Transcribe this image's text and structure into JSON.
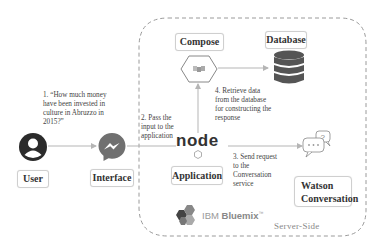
{
  "nodes": {
    "user": {
      "label": "User",
      "icon": "user-icon"
    },
    "interface": {
      "label": "Interface",
      "icon": "messenger-icon"
    },
    "compose": {
      "label": "Compose",
      "icon": "compose-hexagon-icon"
    },
    "database": {
      "label": "Database",
      "icon": "database-icon"
    },
    "application": {
      "label": "Application",
      "icon": "nodejs-icon",
      "logo_text": "node"
    },
    "watson": {
      "label_line1": "Watson",
      "label_line2": "Conversation",
      "icon": "chat-bubbles-icon"
    }
  },
  "steps": {
    "step1": {
      "line1": "1. “How much money",
      "line2": "have been invested in",
      "line3": "culture in Abruzzo in",
      "line4": "2015?”"
    },
    "step2": {
      "line1": "2. Pass the",
      "line2": "input to the",
      "line3": "application"
    },
    "step3": {
      "line1": "3. Send request",
      "line2": "to the",
      "line3": "Conversation",
      "line4": "service"
    },
    "step4": {
      "line1": "4. Retrieve data",
      "line2": "from the database",
      "line3": "for constructing the",
      "line4": "response"
    }
  },
  "platform": {
    "brand_prefix": "IBM",
    "brand_name": "Bluemix",
    "trademark": "™",
    "region_label": "Server-Side"
  },
  "colors": {
    "dashed_border": "#9a9a9a",
    "arrow": "#b5b5b5",
    "icon_dark": "#2b2b2b",
    "messenger_gray": "#707070",
    "database_gray": "#555555"
  }
}
